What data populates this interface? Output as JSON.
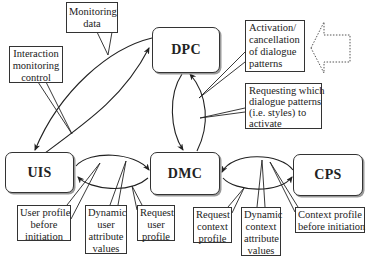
{
  "nodes": {
    "dpc": "DPC",
    "uis": "UIS",
    "dmc": "DMC",
    "cps": "CPS"
  },
  "callouts": {
    "monitoring_data": [
      "Monitoring",
      "data"
    ],
    "interaction_monitoring_control": [
      "Interaction",
      "monitoring",
      "control"
    ],
    "activation_cancellation": [
      "Activation/",
      "cancellation",
      "of dialogue",
      "patterns"
    ],
    "requesting_patterns": [
      "Requesting which",
      "dialogue patterns",
      "(i.e. styles) to",
      "activate"
    ],
    "user_profile_before_initiation": [
      "User profile",
      "before",
      "initiation"
    ],
    "dynamic_user_attribute_values": [
      "Dynamic",
      "user",
      "attribute",
      "values"
    ],
    "request_user_profile": [
      "Request",
      "user",
      "profile"
    ],
    "request_context_profile": [
      "Request",
      "context",
      "profile"
    ],
    "dynamic_context_attribute_values": [
      "Dynamic",
      "context",
      "attribute",
      "values"
    ],
    "context_profile_before_initiation": [
      "Context profile",
      "before initiation"
    ]
  },
  "colors": {
    "line": "#222222",
    "box_border": "#333333",
    "shadow": "#9a9a9a",
    "dotted_arrow": "#555555"
  },
  "decorations": {
    "input_arrow": "dotted-left-arrow-icon"
  }
}
